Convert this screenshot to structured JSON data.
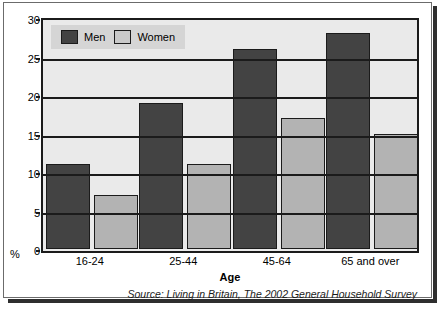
{
  "chart_data": {
    "type": "bar",
    "title": "",
    "categories": [
      "16-24",
      "25-44",
      "45-64",
      "65 and over"
    ],
    "series": [
      {
        "name": "Men",
        "values": [
          11,
          19,
          26,
          28
        ],
        "color": "#434343"
      },
      {
        "name": "Women",
        "values": [
          7,
          11,
          17,
          15
        ],
        "color": "#b3b3b3"
      }
    ],
    "xlabel": "Age",
    "ylabel": "%",
    "ylim": [
      0,
      30
    ],
    "yticks": [
      0,
      5,
      10,
      15,
      20,
      25,
      30
    ],
    "ytick_labels": [
      "0",
      "5",
      "10",
      "15",
      "20",
      "25",
      "30"
    ],
    "grid": true,
    "legend_position": "top-left",
    "source": "Source: Living in Britain, The 2002 General Household Survey",
    "plot_background": "#eaeaea",
    "axis_color": "#1b1b1b"
  }
}
